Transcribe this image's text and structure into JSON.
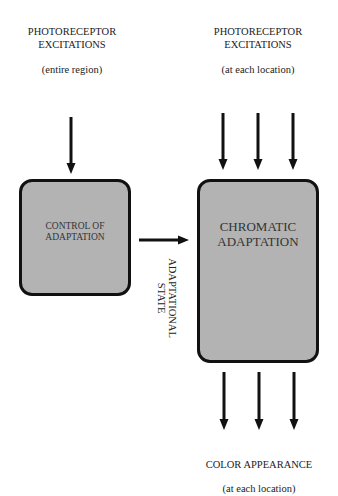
{
  "diagram": {
    "left_input": {
      "title_line1": "PHOTORECEPTOR",
      "title_line2": "EXCITATIONS",
      "subtitle": "(entire region)"
    },
    "right_input": {
      "title_line1": "PHOTORECEPTOR",
      "title_line2": "EXCITATIONS",
      "subtitle": "(at each location)"
    },
    "control_box": {
      "line1": "CONTROL OF",
      "line2": "ADAPTATION",
      "fill": "#b3b3b3"
    },
    "chromatic_box": {
      "line1": "CHROMATIC",
      "line2": "ADAPTATION",
      "fill": "#b3b3b3"
    },
    "connector_label": {
      "line1": "ADAPTATIONAL",
      "line2": "STATE"
    },
    "output": {
      "title": "COLOR APPEARANCE",
      "subtitle": "(at each location)"
    },
    "arrow_color": "#111111"
  }
}
